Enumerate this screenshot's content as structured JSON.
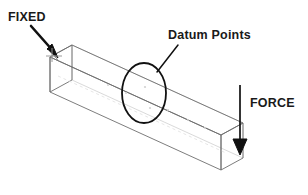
{
  "diagram": {
    "type": "isometric-wireframe",
    "background_color": "#ffffff",
    "line_color_solid": "#5a5a5a",
    "line_color_hidden": "#c8c8c8",
    "annotation_color": "#1a1a1a",
    "labels": {
      "fixed": "FIXED",
      "datum_points": "Datum Points",
      "force": "FORCE"
    },
    "annotations": [
      {
        "name": "fixed-constraint",
        "label": "FIXED",
        "marker": "arrow",
        "direction": "down-right",
        "target": "left-end-face"
      },
      {
        "name": "datum-points-callout",
        "label": "Datum Points",
        "marker": "leader-line-with-ellipse",
        "direction": "down-left",
        "target": "mid-span-top-edge"
      },
      {
        "name": "applied-force",
        "label": "FORCE",
        "marker": "arrow",
        "direction": "down",
        "target": "right-end-face"
      }
    ]
  }
}
